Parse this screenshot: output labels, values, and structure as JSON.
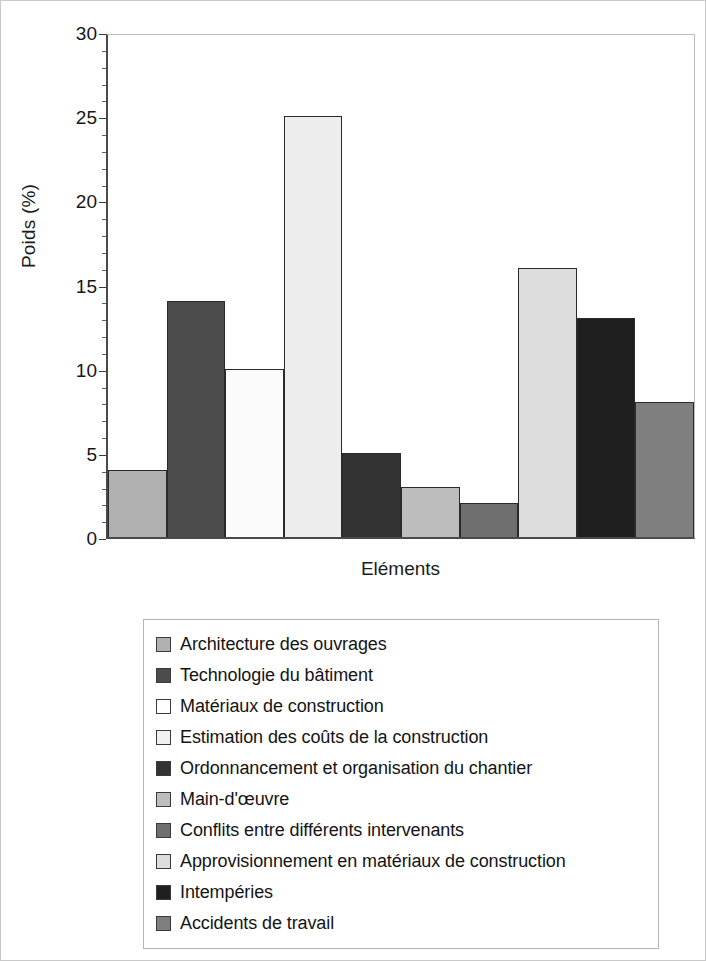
{
  "chart_data": {
    "type": "bar",
    "title": "",
    "subtitle": "",
    "xlabel": "Eléments",
    "ylabel": "Poids (%)",
    "ylim": [
      0,
      30
    ],
    "yticks": [
      0,
      5,
      10,
      15,
      20,
      25,
      30
    ],
    "ytick_labels": [
      "0",
      "5",
      "10",
      "15",
      "20",
      "25",
      "30"
    ],
    "grid": false,
    "legend_position": "below-plot",
    "xtick_labels": [],
    "categories": [
      "Architecture des ouvrages",
      "Technologie du bâtiment",
      "Matériaux de construction",
      "Estimation des coûts de la construction",
      "Ordonnancement et organisation du chantier",
      "Main-d'œuvre",
      "Conflits entre différents intervenants",
      "Approvisionnement en matériaux de construction",
      "Intempéries",
      "Accidents de travail"
    ],
    "values": [
      4,
      14,
      10,
      25,
      5,
      3,
      2,
      16,
      13,
      8
    ],
    "colors": [
      "#b1b1b1",
      "#4c4c4c",
      "#fbfbfb",
      "#ededed",
      "#333333",
      "#bdbdbd",
      "#6f6f6f",
      "#dcdcdc",
      "#1f1f1f",
      "#7f7f7f"
    ],
    "bar_edge_color": "#2a2a2a"
  },
  "axes": {
    "y_title": "Poids (%)",
    "x_title": "Eléments",
    "y_tick_labels": [
      "0",
      "5",
      "10",
      "15",
      "20",
      "25",
      "30"
    ]
  },
  "legend": {
    "items": [
      {
        "label": "Architecture des ouvrages",
        "color": "#b1b1b1"
      },
      {
        "label": "Technologie du bâtiment",
        "color": "#4c4c4c"
      },
      {
        "label": "Matériaux de construction",
        "color": "#ffffff"
      },
      {
        "label": "Estimation des coûts de la construction",
        "color": "#f0f0f0"
      },
      {
        "label": "Ordonnancement et organisation du chantier",
        "color": "#333333"
      },
      {
        "label": "Main-d'œuvre",
        "color": "#bdbdbd"
      },
      {
        "label": "Conflits entre différents intervenants",
        "color": "#6f6f6f"
      },
      {
        "label": "Approvisionnement en matériaux de construction",
        "color": "#dcdcdc"
      },
      {
        "label": "Intempéries",
        "color": "#1f1f1f"
      },
      {
        "label": "Accidents de travail",
        "color": "#7f7f7f"
      }
    ]
  }
}
